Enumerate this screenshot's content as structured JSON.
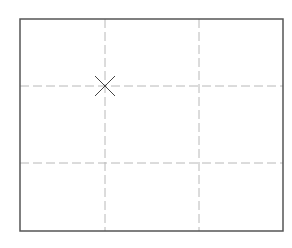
{
  "canvas": {
    "width": 292,
    "height": 248,
    "background": "#ffffff"
  },
  "frame": {
    "x": 20,
    "y": 19,
    "width": 263,
    "height": 212,
    "stroke": "#555555",
    "stroke_width": 1.5
  },
  "grid": {
    "stroke": "#b8b8b8",
    "dash": "9 4",
    "vertical_lines_x": [
      105,
      199
    ],
    "horizontal_lines_y": [
      86,
      163
    ]
  },
  "marker": {
    "shape": "x-cross",
    "cx": 105,
    "cy": 86,
    "half_size": 10,
    "stroke": "#444444"
  }
}
